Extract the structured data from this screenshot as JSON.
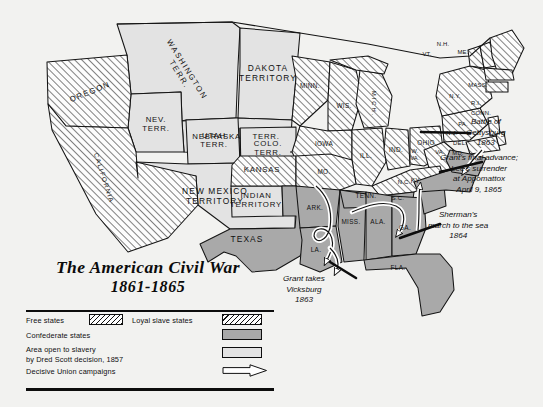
{
  "title": {
    "main": "The American Civil War",
    "subtitle": "1861-1865"
  },
  "legend": {
    "items": [
      {
        "label": "Free states",
        "swatch": "hatch"
      },
      {
        "label": "Loyal slave states",
        "swatch": "hatch"
      },
      {
        "label": "Confederate states",
        "swatch": "solid-gray",
        "color": "#a9a9a9"
      },
      {
        "label": "Area open to slavery\nby Dred Scott decision, 1857",
        "swatch": "solid-light",
        "color": "#e3e3e3"
      },
      {
        "label": "Decisive Union campaigns",
        "swatch": "arrow-outline"
      }
    ]
  },
  "annotations": [
    {
      "name": "gettysburg",
      "text": "Battle of\nGettysburg\n1863"
    },
    {
      "name": "appomattox",
      "text": "Grant's final advance;\nLee's surrender\nat Appomattox\nApril 9, 1865"
    },
    {
      "name": "sherman",
      "text": "Sherman's\nmarch to the sea\n1864"
    },
    {
      "name": "vicksburg",
      "text": "Grant takes\nVicksburg\n1863"
    }
  ],
  "map_labels": {
    "territories": [
      {
        "id": "washington-terr",
        "text": "WASHINGTON\nTERR."
      },
      {
        "id": "dakota-territory",
        "text": "DAKOTA\nTERRITORY"
      },
      {
        "id": "nebraska-terr",
        "text": "NEBRASKA    TERR."
      },
      {
        "id": "utah-terr",
        "text": "UTAH\nTERR."
      },
      {
        "id": "nev-terr",
        "text": "NEV.\nTERR."
      },
      {
        "id": "colo-terr",
        "text": "COLO.\nTERR."
      },
      {
        "id": "new-mexico-territory",
        "text": "NEW MEXICO\nTERRITORY"
      },
      {
        "id": "indian-territory",
        "text": "INDIAN\nTERRITORY"
      }
    ],
    "free_states": [
      {
        "id": "oregon",
        "text": "OREGON"
      },
      {
        "id": "california",
        "text": "CALIFORNIA"
      },
      {
        "id": "minn",
        "text": "MINN."
      },
      {
        "id": "wis",
        "text": "WIS."
      },
      {
        "id": "iowa",
        "text": "IOWA"
      },
      {
        "id": "mich",
        "text": "MICH."
      },
      {
        "id": "ill",
        "text": "ILL."
      },
      {
        "id": "ind",
        "text": "IND."
      },
      {
        "id": "ohio",
        "text": "OHIO"
      },
      {
        "id": "kansas",
        "text": "KANSAS"
      },
      {
        "id": "pa",
        "text": "PA."
      },
      {
        "id": "ny",
        "text": "N.Y."
      },
      {
        "id": "vt",
        "text": "VT."
      },
      {
        "id": "nh",
        "text": "N.H."
      },
      {
        "id": "me",
        "text": "ME."
      },
      {
        "id": "mass",
        "text": "MASS."
      },
      {
        "id": "ri",
        "text": "R.I."
      },
      {
        "id": "conn",
        "text": "CONN."
      },
      {
        "id": "nj",
        "text": "N.J."
      },
      {
        "id": "w-va",
        "text": "W.\nVA."
      }
    ],
    "loyal_slave_states": [
      {
        "id": "mo",
        "text": "MO."
      },
      {
        "id": "ky",
        "text": "KY."
      },
      {
        "id": "del",
        "text": "DEL."
      },
      {
        "id": "md",
        "text": "MD."
      }
    ],
    "confederate_states": [
      {
        "id": "texas",
        "text": "TEXAS"
      },
      {
        "id": "ark",
        "text": "ARK."
      },
      {
        "id": "la",
        "text": "LA."
      },
      {
        "id": "miss",
        "text": "MISS."
      },
      {
        "id": "ala",
        "text": "ALA."
      },
      {
        "id": "tenn",
        "text": "TENN."
      },
      {
        "id": "ga",
        "text": "GA."
      },
      {
        "id": "fla",
        "text": "FLA."
      },
      {
        "id": "sc",
        "text": "S.C."
      },
      {
        "id": "nc",
        "text": "N.C."
      },
      {
        "id": "va",
        "text": "VA."
      }
    ]
  },
  "colors": {
    "page_background": "#f2f2f0",
    "confederate_fill": "#a9a9a9",
    "slavery_area_fill": "#e3e3e3",
    "free_state_fill": "#fdfdfd",
    "outline": "#111111",
    "arrow_fill": "#ffffff"
  }
}
